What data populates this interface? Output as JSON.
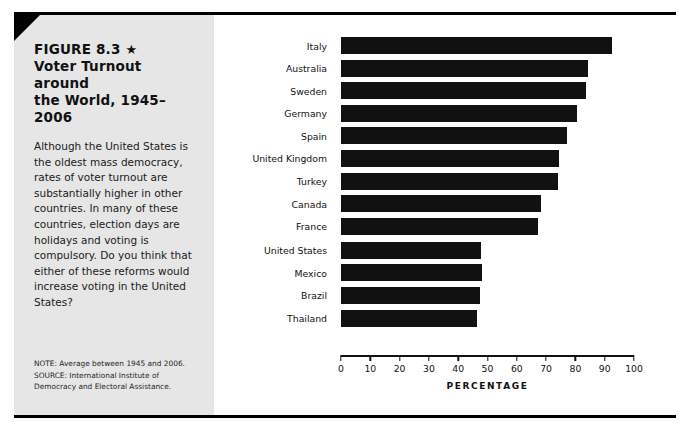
{
  "figure": {
    "label": "FIGURE 8.3",
    "star": "★",
    "title_line1": "Voter Turnout around",
    "title_line2": "the World, 1945–2006",
    "body": "Although the United States is the oldest mass democracy, rates of voter turnout are substantially higher in other countries. In many of these countries, election days are holidays and voting is compulsory. Do you think that either of these reforms would increase voting in the United States?",
    "note": "NOTE: Average between 1945 and 2006.",
    "source_line1": "SOURCE: International Institute of",
    "source_line2": "Democracy and Electoral Assistance."
  },
  "colors": {
    "panel_background": "#e6e6e6",
    "bar": "#111111",
    "frame": "#000000",
    "chart_background": "#ffffff"
  },
  "chart_data": {
    "type": "bar",
    "orientation": "horizontal",
    "title": "Voter Turnout around the World, 1945–2006",
    "xlabel": "PERCENTAGE",
    "ylabel": "",
    "xlim": [
      0,
      100
    ],
    "xticks": [
      0,
      10,
      20,
      30,
      40,
      50,
      60,
      70,
      80,
      90,
      100
    ],
    "xtick_labels": [
      "0",
      "10",
      "20",
      "30",
      "40",
      "50",
      "60",
      "70",
      "80",
      "90",
      "100"
    ],
    "grid": false,
    "legend": null,
    "categories": [
      "Italy",
      "Australia",
      "Sweden",
      "Germany",
      "Spain",
      "United Kingdom",
      "Turkey",
      "Canada",
      "France",
      "United States",
      "Mexico",
      "Brazil",
      "Thailand"
    ],
    "values": [
      92.5,
      84.4,
      83.6,
      80.6,
      77.0,
      74.5,
      74.0,
      68.4,
      67.3,
      47.7,
      48.0,
      47.4,
      46.5
    ]
  }
}
